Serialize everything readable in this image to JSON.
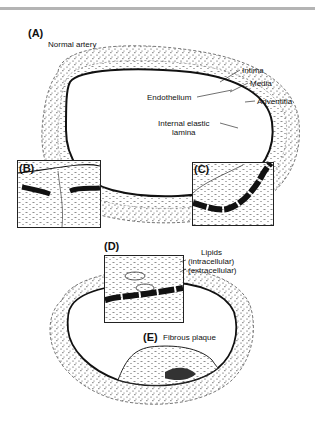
{
  "figure": {
    "panels": [
      {
        "id": "A",
        "label": "(A)",
        "title": "Normal artery"
      },
      {
        "id": "B",
        "label": "(B)"
      },
      {
        "id": "C",
        "label": "(C)"
      },
      {
        "id": "D",
        "label": "(D)"
      },
      {
        "id": "E",
        "label": "(E)",
        "title": "Fibrous plaque"
      }
    ],
    "annotations": {
      "intima": "Intima",
      "media": "Media",
      "adventitia": "Adventitia",
      "endothelium": "Endothelium",
      "internal_elastic_1": "Internal elastic",
      "internal_elastic_2": "lamina",
      "lipids": "Lipids",
      "intracellular": "(intracellular)",
      "extracellular": "(extracellular)"
    },
    "colors": {
      "ink": "#111111",
      "rule": "#b4b4b4",
      "background": "#ffffff"
    }
  }
}
